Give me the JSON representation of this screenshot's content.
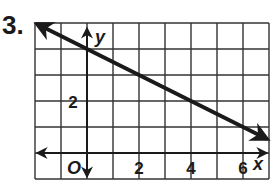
{
  "problem": {
    "number": "3."
  },
  "chart_data": {
    "type": "line",
    "title": "",
    "xlabel": "x",
    "ylabel": "y",
    "origin_label": "O",
    "xlim": [
      -2,
      7
    ],
    "ylim": [
      -1,
      5
    ],
    "grid": true,
    "grid_step": 1,
    "x_tick_labels": [
      "2",
      "4",
      "6"
    ],
    "x_tick_values": [
      2,
      4,
      6
    ],
    "y_tick_labels": [
      "2"
    ],
    "y_tick_values": [
      2
    ],
    "series": [
      {
        "name": "line",
        "equation": "y = -1/2 x + 4",
        "slope": -0.5,
        "intercept": 4,
        "x": [
          -2,
          7
        ],
        "y": [
          5,
          0.5
        ],
        "arrows": "both"
      }
    ],
    "colors": {
      "line": "#1a1a1a",
      "grid": "#333333"
    }
  }
}
